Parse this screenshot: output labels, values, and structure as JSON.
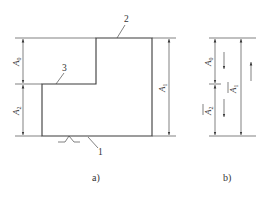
{
  "figure": {
    "a": {
      "caption": "a)",
      "part_labels": [
        {
          "id": "1",
          "text": "1",
          "x": 99,
          "y": 153
        },
        {
          "id": "2",
          "text": "2",
          "x": 124,
          "y": 21
        },
        {
          "id": "3",
          "text": "3",
          "x": 62,
          "y": 70
        }
      ],
      "dimensions": [
        {
          "id": "A0",
          "main": "A",
          "sub": "0",
          "x": 18,
          "y": 61
        },
        {
          "id": "A2",
          "main": "A",
          "sub": "2",
          "x": 18,
          "y": 110
        },
        {
          "id": "A1",
          "main": "A",
          "sub": "1",
          "x": 173,
          "y": 87
        }
      ]
    },
    "b": {
      "caption": "b)",
      "dimensions": [
        {
          "id": "A0",
          "main": "A",
          "sub": "0",
          "overbar": false
        },
        {
          "id": "A2",
          "main": "A",
          "sub": "2",
          "overbar": true
        },
        {
          "id": "A1",
          "main": "A",
          "sub": "1",
          "overbar": true
        }
      ],
      "direction_arrows": [
        {
          "for": "A0",
          "direction": "down"
        },
        {
          "for": "A2",
          "direction": "down"
        },
        {
          "for": "A1",
          "direction": "up"
        }
      ]
    }
  },
  "colors": {
    "line": "#3a3a3a",
    "background": "#ffffff"
  }
}
